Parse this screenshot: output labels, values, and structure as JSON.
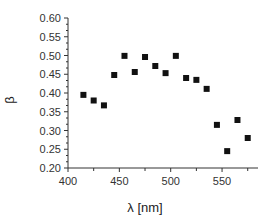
{
  "chart_data": {
    "type": "scatter",
    "title": "",
    "xlabel": "λ [nm]",
    "ylabel": "β",
    "xlim": [
      400,
      585
    ],
    "ylim": [
      0.2,
      0.6
    ],
    "xticks": [
      400,
      450,
      500,
      550
    ],
    "xticks_minor": [
      425,
      475,
      525,
      575
    ],
    "yticks": [
      0.2,
      0.25,
      0.3,
      0.35,
      0.4,
      0.45,
      0.5,
      0.55,
      0.6
    ],
    "ytick_labels": [
      "0.20",
      "0.25",
      "0.30",
      "0.35",
      "0.40",
      "0.45",
      "0.50",
      "0.55",
      "0.60"
    ],
    "grid": false,
    "legend": null,
    "marker": "square",
    "marker_color": "#111111",
    "series": [
      {
        "name": "β",
        "x": [
          415,
          425,
          435,
          445,
          455,
          465,
          475,
          485,
          495,
          505,
          515,
          525,
          535,
          545,
          555,
          565,
          575
        ],
        "y": [
          0.395,
          0.38,
          0.367,
          0.448,
          0.499,
          0.456,
          0.496,
          0.472,
          0.453,
          0.499,
          0.44,
          0.435,
          0.411,
          0.315,
          0.245,
          0.328,
          0.28
        ]
      }
    ]
  }
}
